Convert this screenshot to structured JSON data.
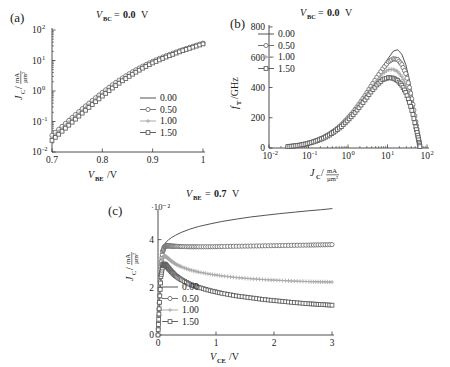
{
  "figure": {
    "panels": [
      "a",
      "b",
      "c"
    ],
    "label_a": "(a)",
    "label_b": "(b)",
    "label_c": "(c)"
  },
  "legend_series": [
    "0.00",
    "0.50",
    "1.00",
    "1.50"
  ],
  "markers": [
    "line",
    "circle",
    "plus",
    "square"
  ],
  "colors": {
    "s0": "#4a4a4a",
    "s1": "#6b6b6b",
    "s2": "#a8a8a8",
    "s3": "#5a5a5a",
    "axis": "#3a3a3a"
  },
  "chart_data": [
    {
      "id": "a",
      "type": "line",
      "panel_label": "(a)",
      "title": "V_BC = 0.0 V",
      "title_var": "V",
      "title_sub": "BC",
      "title_eq": "=",
      "title_val": "0.0",
      "title_unit": "V",
      "xlabel": "V_BE / V",
      "xlabel_var": "V",
      "xlabel_sub": "BE",
      "xlabel_unit": "/V",
      "ylabel": "J_C / (mA/µm²)",
      "ylabel_var": "J",
      "ylabel_sub": "C",
      "ylabel_num": "mA",
      "ylabel_den": "µm²",
      "xscale": "linear",
      "yscale": "log",
      "xlim": [
        0.7,
        1.0
      ],
      "ylim": [
        0.01,
        100
      ],
      "xticks": [
        0.7,
        0.8,
        0.9,
        1.0
      ],
      "xticklabels": [
        "0.7",
        "0.8",
        "0.9",
        "1"
      ],
      "yticks": [
        0.01,
        0.1,
        1,
        10,
        100
      ],
      "yticklabels": [
        "10⁻²",
        "10⁻¹",
        "10⁰",
        "10¹",
        "10²"
      ],
      "grid": false,
      "legend_position": "lower-right",
      "legend_title": "",
      "x": [
        0.7,
        0.72,
        0.74,
        0.76,
        0.78,
        0.8,
        0.82,
        0.84,
        0.86,
        0.88,
        0.9,
        0.92,
        0.94,
        0.96,
        0.98,
        1.0
      ],
      "series": [
        {
          "name": "0.00",
          "marker": "line",
          "values": [
            0.039,
            0.077,
            0.15,
            0.29,
            0.54,
            0.98,
            1.72,
            2.85,
            4.5,
            6.8,
            9.8,
            13.5,
            18.0,
            23.5,
            30.0,
            38.0
          ]
        },
        {
          "name": "0.50",
          "marker": "circle",
          "values": [
            0.035,
            0.069,
            0.135,
            0.262,
            0.49,
            0.9,
            1.6,
            2.68,
            4.3,
            6.5,
            9.4,
            13.0,
            17.4,
            22.8,
            29.2,
            37.0
          ]
        },
        {
          "name": "1.00",
          "marker": "plus",
          "values": [
            0.03,
            0.06,
            0.118,
            0.23,
            0.435,
            0.8,
            1.44,
            2.45,
            3.95,
            6.1,
            8.9,
            12.4,
            16.7,
            22.0,
            28.3,
            36.0
          ]
        },
        {
          "name": "1.50",
          "marker": "square",
          "values": [
            0.024,
            0.048,
            0.095,
            0.188,
            0.36,
            0.68,
            1.25,
            2.16,
            3.55,
            5.6,
            8.3,
            11.7,
            15.9,
            21.1,
            27.3,
            35.0
          ]
        }
      ]
    },
    {
      "id": "b",
      "type": "line",
      "panel_label": "(b)",
      "title": "V_BC = 0.0 V",
      "title_var": "V",
      "title_sub": "BC",
      "title_eq": "=",
      "title_val": "0.0",
      "title_unit": "V",
      "xlabel": "J_C / (mA/µm²)",
      "xlabel_var": "J",
      "xlabel_sub": "C",
      "xlabel_num": "mA",
      "xlabel_den": "µm²",
      "ylabel": "f_T / GHz",
      "ylabel_var": "f",
      "ylabel_sub": "T",
      "ylabel_unit": "/GHz",
      "xscale": "log",
      "yscale": "linear",
      "xlim": [
        0.01,
        100
      ],
      "ylim": [
        0,
        800
      ],
      "xticks": [
        0.01,
        0.1,
        1,
        10,
        100
      ],
      "xticklabels": [
        "10⁻²",
        "10⁻¹",
        "10⁰",
        "10¹",
        "10²"
      ],
      "yticks": [
        0,
        200,
        400,
        600,
        800
      ],
      "yticklabels": [
        "0",
        "200",
        "400",
        "600",
        "800"
      ],
      "grid": false,
      "legend_position": "upper-left",
      "peak_values": [
        650,
        590,
        520,
        465
      ],
      "peak_x": [
        16,
        14,
        13,
        12
      ],
      "x": [
        0.03,
        0.042,
        0.06,
        0.085,
        0.12,
        0.17,
        0.24,
        0.34,
        0.48,
        0.68,
        0.95,
        1.35,
        1.9,
        2.7,
        3.8,
        5.4,
        7.6,
        10.5,
        14.0,
        18.0,
        23.0,
        29.0,
        36.0,
        44.0,
        52.0,
        58.0,
        63.0,
        66.0
      ],
      "series": [
        {
          "name": "0.00",
          "marker": "line",
          "values": [
            10,
            14,
            20,
            28,
            39,
            53,
            71,
            94,
            122,
            155,
            196,
            242,
            295,
            353,
            415,
            478,
            538,
            594,
            640,
            650,
            620,
            552,
            448,
            318,
            190,
            110,
            50,
            12
          ]
        },
        {
          "name": "0.50",
          "marker": "circle",
          "values": [
            10,
            14,
            20,
            28,
            39,
            53,
            70,
            93,
            120,
            153,
            193,
            238,
            290,
            347,
            408,
            468,
            524,
            570,
            590,
            585,
            552,
            492,
            400,
            288,
            175,
            102,
            46,
            11
          ]
        },
        {
          "name": "1.00",
          "marker": "plus",
          "values": [
            10,
            13,
            19,
            27,
            38,
            51,
            68,
            90,
            117,
            149,
            187,
            231,
            281,
            335,
            392,
            446,
            492,
            518,
            520,
            506,
            472,
            418,
            342,
            250,
            156,
            92,
            42,
            10
          ]
        },
        {
          "name": "1.50",
          "marker": "square",
          "values": [
            9,
            13,
            18,
            26,
            36,
            49,
            65,
            86,
            112,
            142,
            179,
            220,
            267,
            318,
            370,
            417,
            452,
            465,
            462,
            446,
            415,
            368,
            302,
            222,
            140,
            84,
            38,
            9
          ]
        }
      ]
    },
    {
      "id": "c",
      "type": "line",
      "panel_label": "(c)",
      "title": "V_BE = 0.7 V",
      "title_var": "V",
      "title_sub": "BE",
      "title_eq": "=",
      "title_val": "0.7",
      "title_unit": "V",
      "xlabel": "V_CE / V",
      "xlabel_var": "V",
      "xlabel_sub": "CE",
      "xlabel_unit": "/V",
      "ylabel": "J_C / (mA/µm²)",
      "ylabel_var": "J",
      "ylabel_sub": "C",
      "ylabel_num": "mA",
      "ylabel_den": "µm²",
      "y_multiplier": "·10⁻²",
      "xscale": "linear",
      "yscale": "linear",
      "xlim": [
        0,
        3
      ],
      "ylim": [
        0,
        5.2
      ],
      "xticks": [
        0,
        1,
        2,
        3
      ],
      "xticklabels": [
        "0",
        "1",
        "2",
        "3"
      ],
      "yticks": [
        0,
        2,
        4
      ],
      "yticklabels": [
        "0",
        "2",
        "4"
      ],
      "grid": false,
      "legend_position": "lower-left",
      "x": [
        0.0,
        0.02,
        0.05,
        0.08,
        0.11,
        0.14,
        0.18,
        0.23,
        0.3,
        0.4,
        0.55,
        0.7,
        0.9,
        1.1,
        1.35,
        1.6,
        1.85,
        2.1,
        2.35,
        2.6,
        2.8,
        3.0
      ],
      "series": [
        {
          "name": "0.00",
          "marker": "line",
          "values": [
            0.0,
            1.4,
            2.9,
            3.55,
            3.8,
            3.9,
            3.99,
            4.08,
            4.18,
            4.3,
            4.44,
            4.55,
            4.66,
            4.76,
            4.86,
            4.95,
            5.02,
            5.09,
            5.15,
            5.21,
            5.25,
            5.3
          ]
        },
        {
          "name": "0.50",
          "marker": "circle",
          "values": [
            0.0,
            1.35,
            2.85,
            3.5,
            3.7,
            3.74,
            3.74,
            3.73,
            3.72,
            3.71,
            3.7,
            3.7,
            3.7,
            3.71,
            3.72,
            3.73,
            3.74,
            3.75,
            3.76,
            3.77,
            3.78,
            3.79
          ]
        },
        {
          "name": "1.00",
          "marker": "plus",
          "values": [
            0.0,
            1.25,
            2.7,
            3.22,
            3.32,
            3.28,
            3.2,
            3.1,
            2.98,
            2.86,
            2.73,
            2.64,
            2.55,
            2.48,
            2.41,
            2.36,
            2.32,
            2.29,
            2.26,
            2.24,
            2.23,
            2.22
          ]
        },
        {
          "name": "1.50",
          "marker": "square",
          "values": [
            0.0,
            1.1,
            2.45,
            2.9,
            2.98,
            2.92,
            2.8,
            2.66,
            2.49,
            2.32,
            2.13,
            2.0,
            1.86,
            1.75,
            1.64,
            1.56,
            1.48,
            1.42,
            1.36,
            1.31,
            1.28,
            1.25
          ]
        }
      ]
    }
  ]
}
